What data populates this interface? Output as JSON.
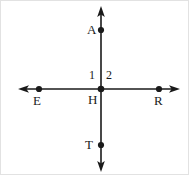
{
  "figure": {
    "type": "geometry-diagram",
    "stroke_color": "#1a1a1a",
    "background_color": "#ffffff",
    "border_color": "#e2e2e2",
    "canvas": {
      "width": 189,
      "height": 175
    },
    "intersection": {
      "x": 100,
      "y": 88
    },
    "lines": [
      {
        "name": "vertical-line",
        "endpoints_label": "A to T",
        "x1": 100,
        "y1": 8,
        "x2": 100,
        "y2": 168,
        "arrow_start": true,
        "arrow_end": true
      },
      {
        "name": "horizontal-line",
        "endpoints_label": "E to R",
        "x1": 20,
        "y1": 88,
        "x2": 176,
        "y2": 88,
        "arrow_start": true,
        "arrow_end": true
      }
    ],
    "points": [
      {
        "label": "A",
        "x": 100,
        "y": 29,
        "label_x": 86,
        "label_y": 22
      },
      {
        "label": "E",
        "x": 38,
        "y": 88,
        "label_x": 32,
        "label_y": 93
      },
      {
        "label": "R",
        "x": 158,
        "y": 88,
        "label_x": 153,
        "label_y": 93
      },
      {
        "label": "T",
        "x": 100,
        "y": 144,
        "label_x": 84,
        "label_y": 137
      },
      {
        "label": "H",
        "x": 100,
        "y": 88,
        "label_x": 87,
        "label_y": 92
      }
    ],
    "angle_labels": [
      {
        "label": "1",
        "x": 88,
        "y": 68
      },
      {
        "label": "2",
        "x": 105,
        "y": 68
      }
    ]
  }
}
